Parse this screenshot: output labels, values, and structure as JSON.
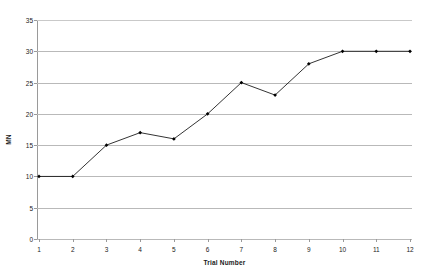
{
  "chart_data": {
    "type": "line",
    "title": "",
    "subtitle": "",
    "xlabel": "Trial Number",
    "ylabel": "MN",
    "categories": [
      "1",
      "2",
      "3",
      "4",
      "5",
      "6",
      "7",
      "8",
      "9",
      "10",
      "11",
      "12"
    ],
    "x": [
      1,
      2,
      3,
      4,
      5,
      6,
      7,
      8,
      9,
      10,
      11,
      12
    ],
    "values": [
      10,
      10,
      15,
      17,
      16,
      20,
      25,
      23,
      28,
      30,
      30,
      30
    ],
    "series": [
      {
        "name": "MN",
        "values": [
          10,
          10,
          15,
          17,
          16,
          20,
          25,
          23,
          28,
          30,
          30,
          30
        ]
      }
    ],
    "ylim": [
      0,
      35
    ],
    "yticks": [
      0,
      5,
      10,
      15,
      20,
      25,
      30,
      35
    ],
    "ytick_labels": [
      "0",
      "5",
      "10",
      "15",
      "20",
      "25",
      "30",
      "35"
    ],
    "xlim": [
      1,
      12
    ],
    "grid": "horizontal",
    "legend": "none",
    "annotations": [],
    "colors": {
      "line": "#000000",
      "marker": "#000000",
      "gridline": "#b9b9b9",
      "axis": "#9a9a9a",
      "background": "#ffffff",
      "text": "#1a1a1a"
    }
  }
}
